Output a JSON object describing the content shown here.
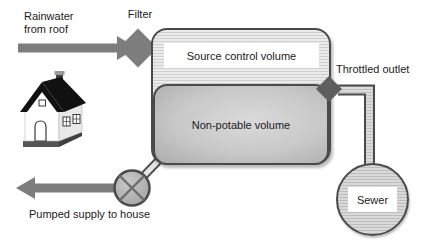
{
  "diagram": {
    "labels": {
      "rainwater_inflow": "Rainwater\nfrom roof",
      "filter": "Filter",
      "source_control_volume": "Source control volume",
      "throttled_outlet": "Throttled outlet",
      "non_potable_volume": "Non-potable volume",
      "sewer": "Sewer",
      "pumped_supply": "Pumped supply to house"
    },
    "colors": {
      "flow_arrow": "#7d7d7d",
      "filter_valve": "#7d7d7d",
      "throttle_valve": "#5e5e5e",
      "outline": "#4a4a4a",
      "tank_stripe_light": "#ebebeb",
      "tank_stripe_dark": "#cfcfcf",
      "non_potable_fill": "#c8c8c8",
      "text": "#1c1c1c",
      "background": "#ffffff"
    }
  }
}
